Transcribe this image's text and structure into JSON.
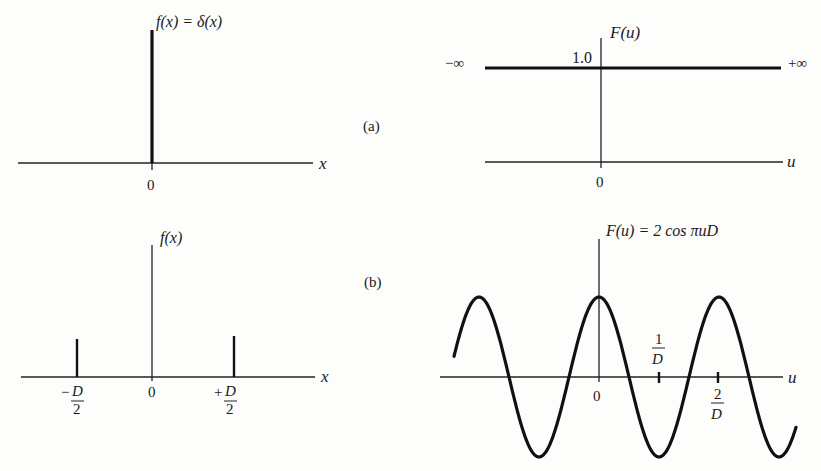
{
  "figure": {
    "panel_a_label": "(a)",
    "panel_b_label": "(b)",
    "a_left": {
      "title": "f(x) = δ(x)",
      "x_axis_label": "x",
      "origin_label": "0"
    },
    "a_right": {
      "title": "F(u)",
      "value_label": "1.0",
      "left_extent": "−∞",
      "right_extent": "+∞",
      "u_axis_label": "u",
      "origin_label": "0"
    },
    "b_left": {
      "title": "f(x)",
      "x_axis_label": "x",
      "origin_label": "0",
      "neg_tick_sign": "−",
      "pos_tick_sign": "+",
      "tick_numerator": "D",
      "tick_denominator": "2"
    },
    "b_right": {
      "title": "F(u) = 2 cos πuD",
      "u_axis_label": "u",
      "origin_label": "0",
      "tick1_num": "1",
      "tick1_den": "D",
      "tick2_num": "2",
      "tick2_den": "D"
    }
  },
  "chart_data": [
    {
      "type": "line",
      "title": "f(x) = δ(x)",
      "xlabel": "x",
      "description": "Unit impulse at x = 0",
      "impulses": [
        {
          "x": 0,
          "height": 1
        }
      ]
    },
    {
      "type": "line",
      "title": "F(u)",
      "xlabel": "u",
      "description": "Constant spectrum F(u) = 1.0 extending from −∞ to +∞",
      "series": [
        {
          "name": "F(u)",
          "x": [
            "-inf",
            "+inf"
          ],
          "y": [
            1.0,
            1.0
          ]
        }
      ]
    },
    {
      "type": "line",
      "title": "f(x)",
      "xlabel": "x",
      "description": "Two impulses at x = −D/2 and x = +D/2",
      "tick_labels": [
        "−D/2",
        "0",
        "+D/2"
      ],
      "impulses": [
        {
          "x": "-D/2",
          "height": 1
        },
        {
          "x": "+D/2",
          "height": 1
        }
      ]
    },
    {
      "type": "line",
      "title": "F(u) = 2 cos πuD",
      "xlabel": "u",
      "tick_labels": [
        "0",
        "1/D",
        "2/D"
      ],
      "description": "Cosine with amplitude 2, period 2/D, peak at u = 0",
      "series": [
        {
          "name": "2 cos πuD",
          "x": [
            -2.3,
            -2.0,
            -1.5,
            -1.0,
            -0.5,
            0,
            0.5,
            1.0,
            1.5,
            2.0,
            2.5,
            2.65
          ],
          "x_units": "1/D",
          "y": [
            1.2,
            2,
            0,
            -2,
            0,
            2,
            0,
            -2,
            0,
            2,
            0,
            -1.2
          ]
        }
      ]
    }
  ]
}
